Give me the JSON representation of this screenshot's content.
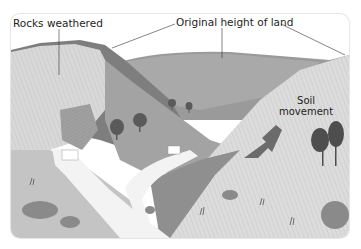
{
  "diagram": {
    "type": "illustrated cross-section of a river valley (V-shaped valley)",
    "labels": {
      "rocks_weathered": "Rocks weathered",
      "original_height": "Original height of land",
      "soil_movement_line1": "Soil",
      "soil_movement_line2": "movement"
    },
    "features": [
      {
        "name": "weathered rock face",
        "position": "left valley side"
      },
      {
        "name": "original land surface",
        "position": "top ridge lines"
      },
      {
        "name": "river with waterfalls",
        "position": "valley floor, flowing toward viewer"
      },
      {
        "name": "soil movement arrow",
        "position": "right slope, pointing down-left"
      },
      {
        "name": "trees",
        "position": "valley interior and right slope"
      }
    ],
    "colors": {
      "background": "#ffffff",
      "sky": "#ffffff",
      "dark_slope": "#7d7d7d",
      "mid_slope": "#a8a8a8",
      "light_slope": "#d9d9d9",
      "river": "#f2f2f2",
      "arrow": "#6b6b6b",
      "text": "#1e1e1e"
    }
  }
}
